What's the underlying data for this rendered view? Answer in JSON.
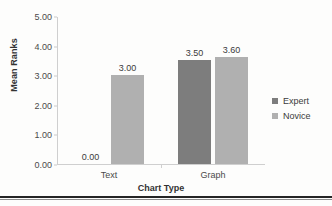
{
  "chart_data": {
    "type": "bar",
    "title": "",
    "xlabel": "Chart Type",
    "ylabel": "Mean Ranks",
    "categories": [
      "Text",
      "Graph"
    ],
    "series": [
      {
        "name": "Expert",
        "values": [
          0.0,
          3.5
        ],
        "color": "#7d7d7d"
      },
      {
        "name": "Novice",
        "values": [
          3.0,
          3.6
        ],
        "color": "#b0b0b0"
      }
    ],
    "value_labels": [
      [
        "0.00",
        "3.50"
      ],
      [
        "3.00",
        "3.60"
      ]
    ],
    "ylim": [
      0.0,
      5.0
    ],
    "ytick_labels": [
      "0.00",
      "1.00",
      "2.00",
      "3.00",
      "4.00",
      "5.00"
    ],
    "ytick_values": [
      0,
      1,
      2,
      3,
      4,
      5
    ],
    "grid": false,
    "legend_position": "right"
  },
  "axis": {
    "y_title": "Mean Ranks",
    "x_title": "Chart Type"
  },
  "legend": {
    "entries": [
      {
        "label": "Expert",
        "color": "#7d7d7d"
      },
      {
        "label": "Novice",
        "color": "#b0b0b0"
      }
    ]
  }
}
